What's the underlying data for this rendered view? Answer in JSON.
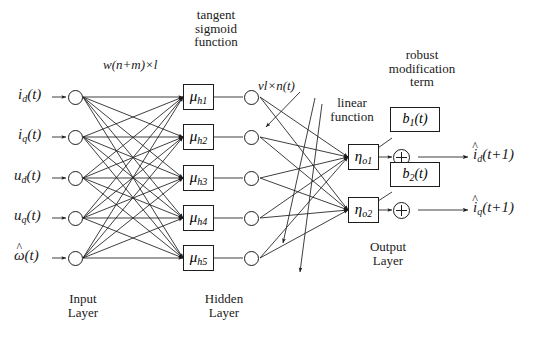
{
  "figure": {
    "type": "neural-network-diagram"
  },
  "annotations": {
    "weights_input_hidden": "w(n+m)×l",
    "weights_hidden_output": "vl×n(t)",
    "tangent_sigmoid": [
      "tangent",
      "sigmoid",
      "function"
    ],
    "linear_function": [
      "linear",
      "function"
    ],
    "robust_term": [
      "robust",
      "modification",
      "term"
    ]
  },
  "layers": {
    "input": {
      "caption": [
        "Input",
        "Layer"
      ],
      "nodes": [
        {
          "label_base": "i",
          "label_sub": "d",
          "label_arg": "(t)",
          "hat": false
        },
        {
          "label_base": "i",
          "label_sub": "q",
          "label_arg": "(t)",
          "hat": false
        },
        {
          "label_base": "u",
          "label_sub": "d",
          "label_arg": "(t)",
          "hat": false
        },
        {
          "label_base": "u",
          "label_sub": "q",
          "label_arg": "(t)",
          "hat": false
        },
        {
          "label_base": "ω",
          "label_sub": "",
          "label_arg": "(t)",
          "hat": true
        }
      ]
    },
    "hidden": {
      "caption": [
        "Hidden",
        "Layer"
      ],
      "units": [
        {
          "box": "μ",
          "sub": "h1"
        },
        {
          "box": "μ",
          "sub": "h2"
        },
        {
          "box": "μ",
          "sub": "h3"
        },
        {
          "box": "μ",
          "sub": "h4"
        },
        {
          "box": "μ",
          "sub": "h5"
        }
      ]
    },
    "output": {
      "caption": [
        "Output",
        "Layer"
      ],
      "units": [
        {
          "box": "η",
          "sub": "o1",
          "bias": {
            "base": "b",
            "sub": "1",
            "arg": "(t)"
          },
          "out": {
            "base": "i",
            "sub": "d",
            "arg": "(t+1)",
            "hat": true
          }
        },
        {
          "box": "η",
          "sub": "o2",
          "bias": {
            "base": "b",
            "sub": "2",
            "arg": "(t)"
          },
          "out": {
            "base": "i",
            "sub": "q",
            "arg": "(t+1)",
            "hat": true
          }
        }
      ]
    }
  },
  "colors": {
    "ink": "#1c1c1c",
    "background": "#ffffff"
  }
}
